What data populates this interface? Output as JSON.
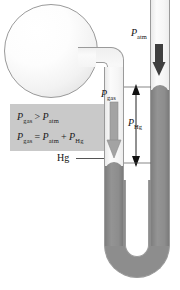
{
  "figure": {
    "colors": {
      "mercury": "#8d8d8d",
      "glass_outline": "#9a9a9a",
      "formula_box_bg": "#c9c9c9",
      "arrow_dark": "#3a3a3a",
      "arrow_gray": "#9e9e9e",
      "text": "#111111"
    }
  },
  "formula_box": {
    "line1": {
      "left": "P",
      "left_sub": "gas",
      "operator": ">",
      "right": "P",
      "right_sub": "atm"
    },
    "line2": {
      "left": "P",
      "left_sub": "gas",
      "operator": "=",
      "mid": "P",
      "mid_sub": "atm",
      "plus": "+",
      "right": "P",
      "right_sub": "Hg"
    }
  },
  "labels": {
    "p_atm": {
      "symbol": "P",
      "subscript": "atm"
    },
    "p_gas": {
      "symbol": "P",
      "subscript": "gas"
    },
    "p_hg": {
      "symbol": "P",
      "subscript": "Hg"
    },
    "mercury": "Hg"
  },
  "arrows": {
    "p_atm_arrow": "down-arrow-dark",
    "p_gas_arrow": "down-arrow-gray",
    "p_hg_arrow": "double-headed-vertical-arrow"
  }
}
